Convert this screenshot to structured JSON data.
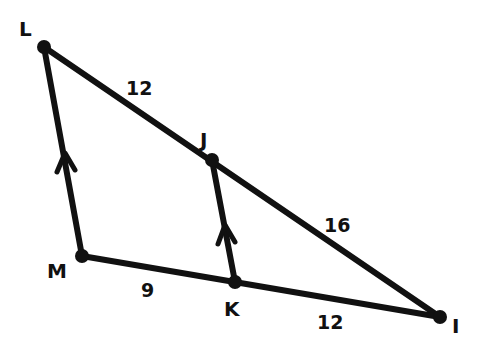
{
  "diagram": {
    "type": "geometry-triangle-parallel-lines",
    "vertices": {
      "L": "L",
      "J": "J",
      "I": "I",
      "M": "M",
      "K": "K"
    },
    "segments": {
      "LJ": "12",
      "JI": "16",
      "MK": "9",
      "KI": "12"
    },
    "parallel_marks": [
      "LM",
      "JK"
    ],
    "colors": {
      "stroke": "#111111",
      "background": "#ffffff"
    }
  }
}
